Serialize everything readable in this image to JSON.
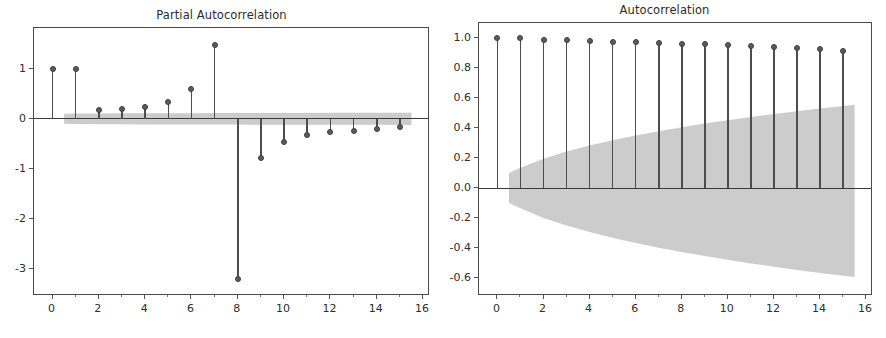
{
  "figure": {
    "width": 886,
    "height": 338,
    "background": "#ffffff",
    "line_color": "#4d4d4d",
    "marker_color": "#5b5b5b",
    "band_color": "#c9c9c9"
  },
  "chart_data": [
    {
      "id": "pacf",
      "type": "stem",
      "title": "Partial Autocorrelation",
      "xlabel": "",
      "ylabel": "",
      "x": [
        0,
        1,
        2,
        3,
        4,
        5,
        6,
        7,
        8,
        9,
        10,
        11,
        12,
        13,
        14,
        15
      ],
      "values": [
        1.0,
        1.0,
        0.17,
        0.2,
        0.24,
        0.34,
        0.6,
        1.48,
        -3.2,
        -0.79,
        -0.46,
        -0.32,
        -0.27,
        -0.24,
        -0.2,
        -0.17
      ],
      "xlim": [
        -0.8,
        16.3
      ],
      "ylim": [
        -3.55,
        1.82
      ],
      "xticks": [
        0,
        2,
        4,
        6,
        8,
        10,
        12,
        14,
        16
      ],
      "xticklabels": [
        "0",
        "2",
        "4",
        "6",
        "8",
        "10",
        "12",
        "14",
        "16"
      ],
      "yticks": [
        1,
        0,
        -1,
        -2,
        -3
      ],
      "yticklabels": [
        "1",
        "0",
        "-1",
        "-2",
        "-3"
      ],
      "grid": false,
      "zero_line": 0,
      "confidence_band": {
        "x": [
          0.5,
          1,
          2,
          3,
          4,
          5,
          6,
          7,
          8,
          9,
          10,
          11,
          12,
          13,
          14,
          15,
          15.5
        ],
        "upper": [
          0.1,
          0.105,
          0.108,
          0.11,
          0.112,
          0.113,
          0.114,
          0.115,
          0.116,
          0.117,
          0.118,
          0.119,
          0.12,
          0.12,
          0.121,
          0.122,
          0.122
        ],
        "lower": [
          -0.1,
          -0.105,
          -0.108,
          -0.11,
          -0.112,
          -0.113,
          -0.114,
          -0.115,
          -0.116,
          -0.117,
          -0.118,
          -0.119,
          -0.12,
          -0.12,
          -0.121,
          -0.122,
          -0.122
        ]
      }
    },
    {
      "id": "acf",
      "type": "stem",
      "title": "Autocorrelation",
      "xlabel": "",
      "ylabel": "",
      "x": [
        0,
        1,
        2,
        3,
        4,
        5,
        6,
        7,
        8,
        9,
        10,
        11,
        12,
        13,
        14,
        15
      ],
      "values": [
        1.0,
        1.0,
        0.99,
        0.985,
        0.978,
        0.976,
        0.973,
        0.968,
        0.962,
        0.958,
        0.951,
        0.947,
        0.94,
        0.932,
        0.924,
        0.914
      ],
      "xlim": [
        -0.8,
        16.3
      ],
      "ylim": [
        -0.72,
        1.1
      ],
      "xticks": [
        0,
        2,
        4,
        6,
        8,
        10,
        12,
        14,
        16
      ],
      "xticklabels": [
        "0",
        "2",
        "4",
        "6",
        "8",
        "10",
        "12",
        "14",
        "16"
      ],
      "yticks": [
        1.0,
        0.8,
        0.6,
        0.4,
        0.2,
        0.0,
        -0.2,
        -0.4,
        -0.6
      ],
      "yticklabels": [
        "1.0",
        "0.8",
        "0.6",
        "0.4",
        "0.2",
        "0.0",
        "-0.2",
        "-0.4",
        "-0.6"
      ],
      "grid": false,
      "zero_line": 0,
      "confidence_band": {
        "x": [
          0.5,
          1,
          2,
          3,
          4,
          5,
          6,
          7,
          8,
          9,
          10,
          11,
          12,
          13,
          14,
          15,
          15.5
        ],
        "upper": [
          0.1,
          0.135,
          0.195,
          0.243,
          0.283,
          0.318,
          0.35,
          0.378,
          0.405,
          0.43,
          0.452,
          0.473,
          0.493,
          0.512,
          0.53,
          0.547,
          0.555
        ],
        "lower": [
          -0.1,
          -0.135,
          -0.2,
          -0.25,
          -0.293,
          -0.332,
          -0.366,
          -0.398,
          -0.427,
          -0.454,
          -0.479,
          -0.503,
          -0.525,
          -0.546,
          -0.566,
          -0.585,
          -0.594
        ]
      }
    }
  ]
}
